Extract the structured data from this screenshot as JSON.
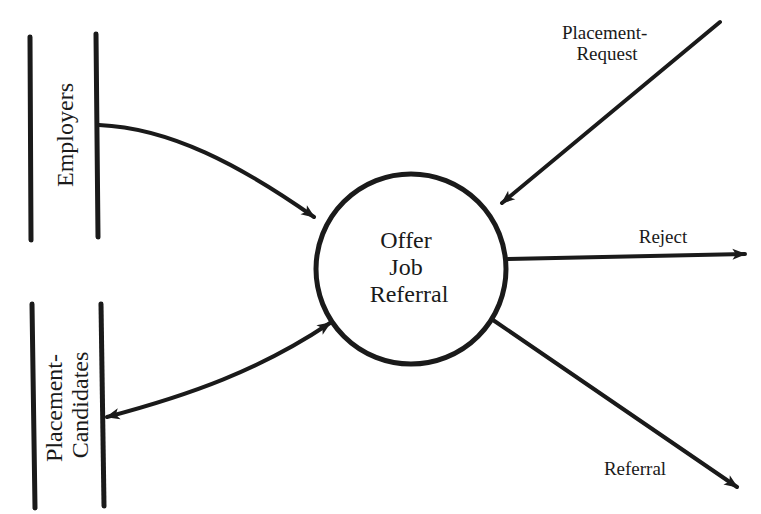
{
  "diagram": {
    "type": "data-flow-diagram",
    "process": {
      "label_lines": [
        "Offer",
        "Job",
        "Referral"
      ]
    },
    "data_stores": [
      {
        "id": "employers",
        "label_lines": [
          "Employers"
        ]
      },
      {
        "id": "placement-candidates",
        "label_lines": [
          "Placement-",
          "Candidates"
        ]
      }
    ],
    "flows": [
      {
        "id": "placement-request",
        "label_lines": [
          "Placement-",
          "Request"
        ],
        "from": "external",
        "to": "process"
      },
      {
        "id": "reject",
        "label_lines": [
          "Reject"
        ],
        "from": "process",
        "to": "external"
      },
      {
        "id": "referral",
        "label_lines": [
          "Referral"
        ],
        "from": "process",
        "to": "external"
      },
      {
        "id": "employers-flow",
        "label_lines": [],
        "from": "employers",
        "to": "process"
      },
      {
        "id": "candidates-flow",
        "label_lines": [],
        "from": "process",
        "to": "placement-candidates",
        "bidirectional": true
      }
    ],
    "colors": {
      "ink": "#1a1a1a",
      "background": "#ffffff"
    }
  }
}
